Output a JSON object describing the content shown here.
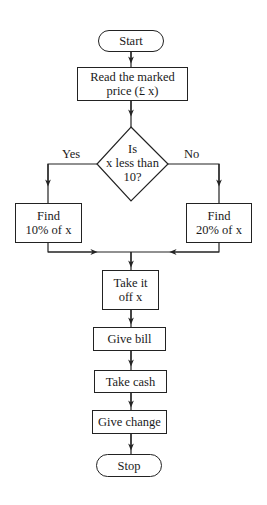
{
  "flowchart": {
    "start": "Start",
    "read_price": "Read the marked\nprice (£ x)",
    "decision": "Is\nx less than\n10?",
    "branch_yes_label": "Yes",
    "branch_no_label": "No",
    "find_10": "Find\n10% of x",
    "find_20": "Find\n20% of x",
    "take_off": "Take it\noff x",
    "give_bill": "Give bill",
    "take_cash": "Take cash",
    "give_change": "Give change",
    "stop": "Stop"
  },
  "colors": {
    "line": "#222222",
    "background": "#ffffff"
  }
}
